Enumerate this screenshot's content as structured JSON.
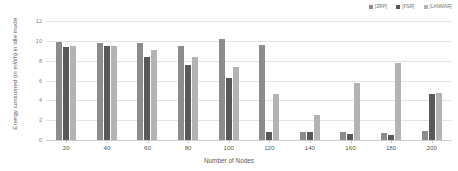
{
  "chart_data": {
    "type": "bar",
    "title": "",
    "xlabel": "Number of Nodes",
    "ylabel": "Energy consumed (in mWh) in idle mode",
    "categories": [
      "20",
      "40",
      "60",
      "80",
      "100",
      "120",
      "140",
      "160",
      "180",
      "200"
    ],
    "series": [
      {
        "name": "[ZRP]",
        "color": "#8c8c8c",
        "values": [
          9.85,
          9.75,
          9.8,
          9.5,
          10.2,
          9.6,
          0.85,
          0.85,
          0.75,
          0.95
        ]
      },
      {
        "name": "[FSR]",
        "color": "#595959",
        "values": [
          9.4,
          9.5,
          8.35,
          7.6,
          6.3,
          0.8,
          0.85,
          0.6,
          0.5,
          4.6
        ]
      },
      {
        "name": "[LANMAR]",
        "color": "#b3b3b3",
        "values": [
          9.5,
          9.45,
          9.1,
          8.4,
          7.35,
          4.6,
          2.5,
          5.75,
          7.8,
          4.7
        ]
      }
    ],
    "ylim": [
      0,
      12
    ],
    "yticks": [
      "0",
      "2",
      "4",
      "6",
      "8",
      "10",
      "12"
    ],
    "grid": true,
    "legend_position": "top-right"
  }
}
